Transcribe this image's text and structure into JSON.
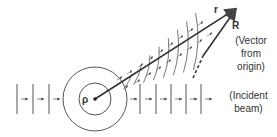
{
  "diagram": {
    "labels": {
      "rho": "ρ",
      "r": "r",
      "R": "R",
      "R_desc_1": "(Vector",
      "R_desc_2": "from",
      "R_desc_3": "origin)",
      "beam_1": "(Incident",
      "beam_2": "beam)"
    },
    "colors": {
      "line": "#444444",
      "background": "#ffffff"
    },
    "origin": [
      95,
      99
    ],
    "tip": [
      237,
      8
    ],
    "incident_wavefronts_left_x": [
      17,
      33,
      49
    ],
    "incident_wavefronts_right_x": [
      140,
      156,
      171,
      186,
      201
    ],
    "circles_radius": [
      16,
      32
    ],
    "scattered_arc_distances": [
      38,
      50,
      62,
      74,
      86,
      98,
      110,
      122
    ]
  }
}
